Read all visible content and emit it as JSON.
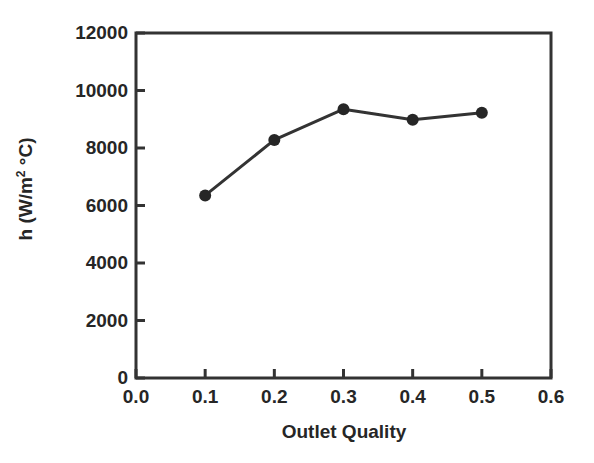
{
  "chart_data": {
    "type": "line",
    "title": "",
    "subtitle": "",
    "xlabel": "Outlet Quality",
    "ylabel": "h (W/m2 °C)",
    "ylabel_parts": {
      "prefix": "h (W/m",
      "superscript": "2",
      "suffix": " °C)"
    },
    "x": [
      0.1,
      0.2,
      0.3,
      0.4,
      0.5
    ],
    "values": [
      6350,
      8280,
      9350,
      8980,
      9230
    ],
    "series": [
      {
        "name": "h",
        "x": [
          0.1,
          0.2,
          0.3,
          0.4,
          0.5
        ],
        "values": [
          6350,
          8280,
          9350,
          8980,
          9230
        ]
      }
    ],
    "xlim": [
      0.0,
      0.6
    ],
    "ylim": [
      0,
      12000
    ],
    "xticks": [
      0.0,
      0.1,
      0.2,
      0.3,
      0.4,
      0.5,
      0.6
    ],
    "xtick_labels": [
      "0.0",
      "0.1",
      "0.2",
      "0.3",
      "0.4",
      "0.5",
      "0.6"
    ],
    "yticks": [
      0,
      2000,
      4000,
      6000,
      8000,
      10000,
      12000
    ],
    "ytick_labels": [
      "0",
      "2000",
      "4000",
      "6000",
      "8000",
      "10000",
      "12000"
    ],
    "grid": false,
    "legend": null,
    "legend_position": "none",
    "annotations": [],
    "colors": {
      "line": "#333333",
      "marker": "#262626",
      "axis": "#333333",
      "text": "#262626",
      "background": "#ffffff"
    },
    "marker": "circle",
    "marker_size": 9,
    "line_width": 3
  }
}
